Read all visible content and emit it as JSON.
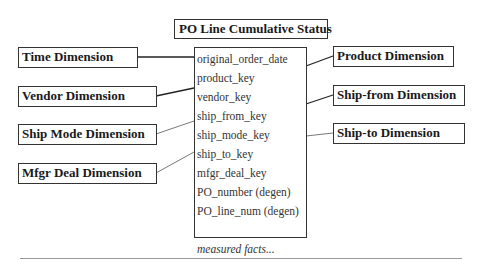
{
  "diagram": {
    "title": "PO Line Cumulative Status",
    "fact_table": {
      "fields": [
        "original_order_date",
        "product_key",
        "vendor_key",
        "ship_from_key",
        "ship_mode_key",
        "ship_to_key",
        "mfgr_deal_key",
        "PO_number (degen)",
        "PO_line_num (degen)"
      ],
      "measured_facts": "measured facts..."
    },
    "left_dimensions": [
      {
        "label": "Time Dimension"
      },
      {
        "label": "Vendor Dimension"
      },
      {
        "label": "Ship Mode Dimension"
      },
      {
        "label": "Mfgr Deal Dimension"
      }
    ],
    "right_dimensions": [
      {
        "label": "Product Dimension"
      },
      {
        "label": "Ship-from Dimension"
      },
      {
        "label": "Ship-to Dimension"
      }
    ]
  }
}
